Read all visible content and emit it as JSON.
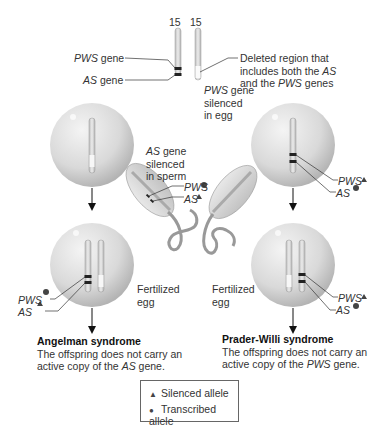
{
  "diagram": {
    "top": {
      "chromosome_labels": [
        "15",
        "15"
      ],
      "pws_gene_label": "PWS",
      "pws_gene_suffix": " gene",
      "as_gene_label": "AS",
      "as_gene_suffix": " gene",
      "deleted_line1": "Deleted region that",
      "deleted_line2_pre": "includes both the ",
      "deleted_line2_it": "AS",
      "deleted_line3_pre": "and the ",
      "deleted_line3_it": "PWS",
      "deleted_line3_post": " genes"
    },
    "sperm": {
      "line1_it": "AS",
      "line1_post": " gene",
      "line2": "silenced",
      "line3": "in sperm",
      "pws": "PWS",
      "as": "AS"
    },
    "egg": {
      "line1_it": "PWS",
      "line1_post": " gene",
      "line2": "silenced",
      "line3": "in egg",
      "pws": "PWS",
      "as": "AS"
    },
    "left_fertilized": {
      "label1": "Fertilized",
      "label2": "egg",
      "pws": "PWS",
      "as": "AS",
      "title": "Angelman syndrome",
      "desc1": "The offspring does not carry an",
      "desc2_pre": "active copy of the ",
      "desc2_it": "AS",
      "desc2_post": " gene."
    },
    "right_fertilized": {
      "label1": "Fertilized",
      "label2": "egg",
      "pws": "PWS",
      "as": "AS",
      "title": "Prader-Willi syndrome",
      "desc1": "The offspring does not carry an",
      "desc2_pre": "active copy of the ",
      "desc2_it": "PWS",
      "desc2_post": " gene."
    },
    "legend": {
      "silenced_symbol": "▲",
      "silenced_label": "Silenced allele",
      "transcribed_symbol": "●",
      "transcribed_label": "Transcribed allele"
    },
    "colors": {
      "sphere_light": "#f2f2f2",
      "sphere_dark": "#b5b5b5",
      "chromosome": "#d6d6d6",
      "band": "#333333",
      "line": "#333333",
      "symbol": "#444444"
    }
  }
}
